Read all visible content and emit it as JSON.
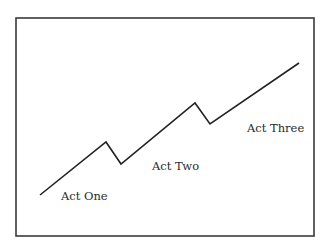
{
  "diagram": {
    "type": "three-act-structure",
    "frame": {
      "x": 16,
      "y": 18,
      "width": 298,
      "height": 218,
      "stroke": "#3a3a3a"
    },
    "line": {
      "stroke": "#222222",
      "points": [
        [
          40,
          195
        ],
        [
          106,
          142
        ],
        [
          121,
          164
        ],
        [
          195,
          103
        ],
        [
          210,
          124
        ],
        [
          299,
          63
        ]
      ]
    },
    "labels": [
      {
        "text": "Act One",
        "x": 61,
        "y": 200
      },
      {
        "text": "Act Two",
        "x": 152,
        "y": 170
      },
      {
        "text": "Act Three",
        "x": 247,
        "y": 132
      }
    ]
  }
}
